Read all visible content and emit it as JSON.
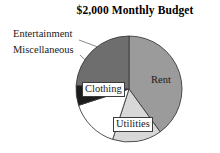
{
  "chart_data": {
    "type": "pie",
    "title": "$2,000 Monthly Budget",
    "xlabel": "",
    "ylabel": "",
    "legend_position": "none",
    "grid": false,
    "labels_on_slices": true,
    "total_label": "$2,000",
    "categories": [
      "Rent",
      "Utilities",
      "Clothing",
      "Miscellaneous",
      "Entertainment"
    ],
    "values": [
      40,
      15,
      15,
      6,
      24
    ],
    "units": "percent",
    "start_angle_deg": 0,
    "direction": "clockwise",
    "slices": [
      {
        "label": "Rent",
        "value": 40,
        "color": "#9b9b9b",
        "label_placement": "inside",
        "start_deg": 0,
        "end_deg": 144
      },
      {
        "label": "Utilities",
        "value": 15,
        "color": "#d8d8d8",
        "label_placement": "inside",
        "start_deg": 144,
        "end_deg": 198
      },
      {
        "label": "Clothing",
        "value": 15,
        "color": "#ffffff",
        "label_placement": "inside",
        "start_deg": 198,
        "end_deg": 252
      },
      {
        "label": "Miscellaneous",
        "value": 6,
        "color": "#1c1c1c",
        "label_placement": "callout",
        "start_deg": 252,
        "end_deg": 274
      },
      {
        "label": "Entertainment",
        "value": 24,
        "color": "#6e6e6e",
        "label_placement": "callout",
        "start_deg": 274,
        "end_deg": 360
      }
    ]
  },
  "chart": {
    "title": "$2,000 Monthly Budget",
    "labels": {
      "rent": "Rent",
      "utilities": "Utilities",
      "clothing": "Clothing",
      "miscellaneous": "Miscellaneous",
      "entertainment": "Entertainment"
    }
  },
  "colors": {
    "rent": "#9b9b9b",
    "utilities": "#d8d8d8",
    "clothing": "#ffffff",
    "miscellaneous": "#1c1c1c",
    "entertainment": "#6e6e6e",
    "outline": "#3c3c3c",
    "leader_line": "#6b6b6b",
    "text": "#1a1a1a",
    "background": "#ffffff"
  }
}
